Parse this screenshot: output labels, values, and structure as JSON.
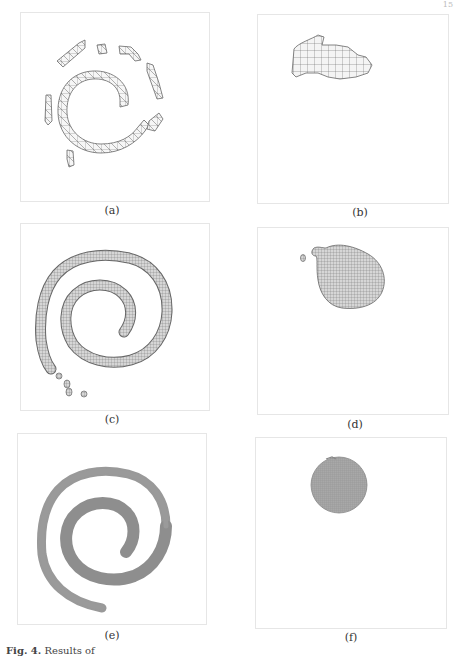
{
  "page": {
    "page_number": "15",
    "caption": {
      "label": "Fig. 4.",
      "text": "Results of"
    }
  },
  "figure": {
    "panels": [
      {
        "id": "a",
        "label": "(a)",
        "content": "fragmented spiral segments, coarse mesh"
      },
      {
        "id": "b",
        "label": "(b)",
        "content": "irregular blob, coarse mesh"
      },
      {
        "id": "c",
        "label": "(c)",
        "content": "spiral with trailing fragments, medium mesh"
      },
      {
        "id": "d",
        "label": "(d)",
        "content": "rounded blob with small fragment, medium mesh"
      },
      {
        "id": "e",
        "label": "(e)",
        "content": "continuous spiral, fine mesh"
      },
      {
        "id": "f",
        "label": "(f)",
        "content": "circular disc, fine mesh"
      }
    ]
  },
  "colors": {
    "mesh_line": "#555555",
    "frame": "#e6e6e6",
    "fine_fill": "#9a9a9a"
  }
}
